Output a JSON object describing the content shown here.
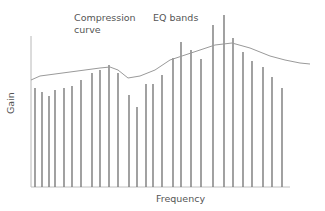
{
  "labels": {
    "compression_line1": "Compression",
    "compression_line2": "curve",
    "eq_bands": "EQ bands",
    "xlabel": "Frequency",
    "ylabel": "Gain"
  },
  "colors": {
    "bars": "#7a7a7a",
    "curve": "#9a9a9a",
    "axis": "#b0b0b0",
    "text": "#555555"
  },
  "chart_data": {
    "type": "bar",
    "title": "",
    "xlabel": "Frequency",
    "ylabel": "Gain",
    "annotations": [
      "Compression curve",
      "EQ bands"
    ],
    "grid": false,
    "series": [
      {
        "name": "EQ bands",
        "x": [
          35,
          42,
          49,
          55,
          64,
          72,
          81,
          92,
          100,
          109,
          118,
          129,
          137,
          146,
          153,
          162,
          173,
          181,
          191,
          201,
          213,
          224,
          233,
          243,
          252,
          263,
          272,
          282
        ],
        "values": [
          99,
          95,
          91,
          97,
          99,
          101,
          107,
          114,
          117,
          122,
          114,
          92,
          80,
          103,
          103,
          112,
          129,
          145,
          137,
          128,
          162,
          172,
          149,
          135,
          126,
          120,
          110,
          99
        ]
      },
      {
        "name": "Compression curve",
        "type": "line",
        "x": [
          31,
          40,
          70,
          100,
          110,
          118,
          128,
          140,
          155,
          170,
          185,
          200,
          215,
          232,
          250,
          270,
          285,
          300,
          310
        ],
        "values": [
          107,
          111,
          115,
          119,
          120,
          117,
          109,
          111,
          117,
          127,
          132,
          137,
          142,
          144,
          139,
          131,
          127,
          124,
          123
        ]
      }
    ]
  }
}
